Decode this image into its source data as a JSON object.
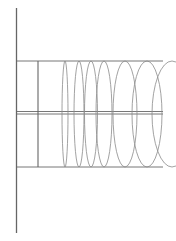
{
  "diagram": {
    "type": "line-drawing",
    "colors": {
      "background": "#ffffff",
      "axis": "#666666",
      "frame": "#777777",
      "ring": "#8a8a8a"
    },
    "axis_vertical": {
      "x": 16.5,
      "y1": 8,
      "y2": 233
    },
    "horizontals": [
      {
        "name": "top-line",
        "y": 61,
        "x1": 16,
        "x2": 163
      },
      {
        "name": "center-line-a",
        "y": 111.5,
        "x1": 16,
        "x2": 163
      },
      {
        "name": "center-line-b",
        "y": 114,
        "x1": 16,
        "x2": 163
      },
      {
        "name": "bottom-line",
        "y": 167,
        "x1": 16,
        "x2": 163
      }
    ],
    "inner_vertical": {
      "x": 38,
      "y1": 61,
      "y2": 167
    },
    "rings": [
      {
        "cx": 65,
        "cy": 114,
        "rx": 3,
        "ry": 53
      },
      {
        "cx": 79,
        "cy": 114,
        "rx": 5,
        "ry": 53
      },
      {
        "cx": 91,
        "cy": 114,
        "rx": 6.5,
        "ry": 53
      },
      {
        "cx": 104,
        "cy": 114,
        "rx": 8,
        "ry": 53
      },
      {
        "cx": 125,
        "cy": 114,
        "rx": 12,
        "ry": 53
      },
      {
        "cx": 147,
        "cy": 114,
        "rx": 15,
        "ry": 53
      },
      {
        "cx": 172,
        "cy": 114,
        "rx": 20,
        "ry": 53
      }
    ]
  }
}
